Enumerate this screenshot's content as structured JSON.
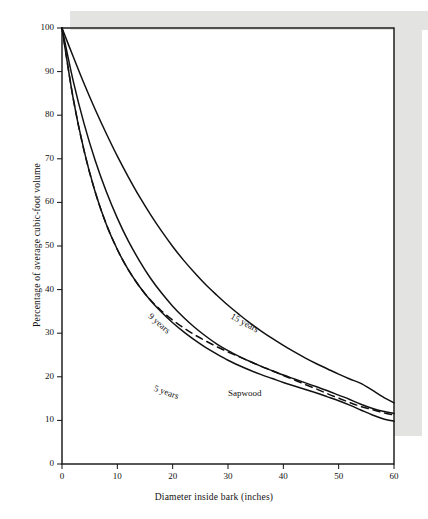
{
  "chart_data": {
    "type": "line",
    "title": "",
    "xlabel": "Diameter inside bark (inches)",
    "ylabel": "Percentage of average cubic-foot volume",
    "xlim": [
      0,
      60
    ],
    "ylim": [
      0,
      100
    ],
    "xticks": [
      0,
      10,
      20,
      30,
      40,
      50,
      60
    ],
    "yticks": [
      0,
      10,
      20,
      30,
      40,
      50,
      60,
      70,
      80,
      90,
      100
    ],
    "grid": false,
    "legend": "inline-curve-labels",
    "x": [
      0,
      2,
      4,
      6,
      8,
      10,
      12,
      14,
      16,
      18,
      20,
      22,
      24,
      26,
      28,
      30,
      32,
      34,
      36,
      38,
      40,
      42,
      44,
      46,
      48,
      50,
      52,
      54,
      56,
      58,
      60
    ],
    "series": [
      {
        "name": "15 years",
        "style": "solid",
        "label": "15 years",
        "values": [
          100,
          93.5,
          87.2,
          81.3,
          75.8,
          70.6,
          65.8,
          61.3,
          57.2,
          53.4,
          49.9,
          46.7,
          43.8,
          41.1,
          38.7,
          36.4,
          34.3,
          32.3,
          30.5,
          28.8,
          27.2,
          25.7,
          24.3,
          23.0,
          21.8,
          20.6,
          19.5,
          18.5,
          17.0,
          15.4,
          14.0
        ]
      },
      {
        "name": "9 years",
        "style": "solid",
        "label": "9 years",
        "values": [
          100,
          88.0,
          78.0,
          69.6,
          62.5,
          56.4,
          51.1,
          46.6,
          42.6,
          39.2,
          36.2,
          33.6,
          31.3,
          29.3,
          27.5,
          26.0,
          24.7,
          23.5,
          22.4,
          21.4,
          20.4,
          19.5,
          18.6,
          17.7,
          16.8,
          15.8,
          14.8,
          13.7,
          12.8,
          12.1,
          11.6
        ]
      },
      {
        "name": "Sapwood",
        "style": "dashed",
        "label": "Sapwood",
        "values": [
          100,
          84.0,
          71.8,
          62.4,
          55.0,
          49.2,
          44.5,
          40.7,
          37.6,
          35.1,
          33.0,
          31.2,
          29.6,
          28.2,
          26.9,
          25.7,
          24.6,
          23.5,
          22.4,
          21.4,
          20.3,
          19.3,
          18.2,
          17.2,
          16.1,
          15.1,
          14.1,
          13.2,
          12.5,
          11.8,
          11.2
        ]
      },
      {
        "name": "5 years",
        "style": "solid",
        "label": "5 years",
        "values": [
          100,
          84.0,
          71.8,
          62.4,
          55.0,
          49.2,
          44.5,
          40.7,
          37.5,
          34.8,
          32.4,
          30.3,
          28.4,
          26.7,
          25.2,
          23.8,
          22.6,
          21.5,
          20.5,
          19.6,
          18.7,
          17.9,
          17.1,
          16.3,
          15.4,
          14.5,
          13.5,
          12.4,
          11.3,
          10.4,
          9.8
        ]
      }
    ],
    "annotations": [
      {
        "text": "15 years",
        "x": 31,
        "y": 35,
        "rotation": 29
      },
      {
        "text": "9 years",
        "x": 16.5,
        "y": 35,
        "rotation": 41
      },
      {
        "text": "5 years",
        "x": 17,
        "y": 18.5,
        "rotation": 20
      },
      {
        "text": "Sapwood",
        "x": 30,
        "y": 17.5,
        "rotation": 0
      }
    ]
  },
  "colors": {
    "ink": "#111111",
    "paper": "#ffffff",
    "scan_band": "#e3e3e1"
  }
}
